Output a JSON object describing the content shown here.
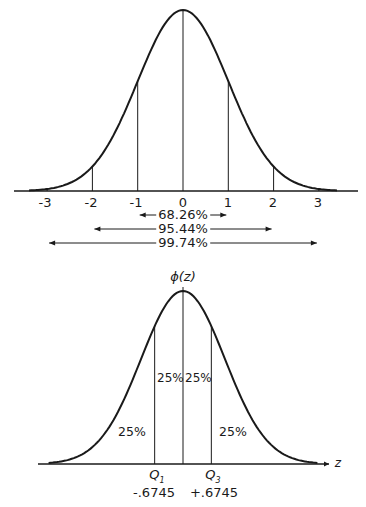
{
  "top_chart": {
    "ticks": [
      "-3",
      "-2",
      "-1",
      "0",
      "1",
      "2",
      "3"
    ],
    "ranges": [
      {
        "label": "68.26%",
        "from": "-1",
        "to": "1"
      },
      {
        "label": "95.44%",
        "from": "-2",
        "to": "2"
      },
      {
        "label": "99.74%",
        "from": "-3",
        "to": "3"
      }
    ]
  },
  "bottom_chart": {
    "y_label": "ϕ(z)",
    "x_label": "z",
    "regions": [
      "25%",
      "25%",
      "25%",
      "25%"
    ],
    "q1": {
      "label": "Q1",
      "value": "-.6745"
    },
    "q3": {
      "label": "Q3",
      "value": "+.6745"
    }
  },
  "chart_data": [
    {
      "type": "area",
      "title": "Standard normal distribution",
      "x": [
        -3,
        -2,
        -1,
        0,
        1,
        2,
        3
      ],
      "xlabel": "",
      "ylabel": "",
      "vertical_lines_at": [
        -2,
        -1,
        0,
        1,
        2
      ],
      "annotations": [
        {
          "text": "68.26%",
          "range": [
            -1,
            1
          ]
        },
        {
          "text": "95.44%",
          "range": [
            -2,
            2
          ]
        },
        {
          "text": "99.74%",
          "range": [
            -3,
            3
          ]
        }
      ]
    },
    {
      "type": "area",
      "title": "Quartiles of standard normal",
      "xlabel": "z",
      "ylabel": "ϕ(z)",
      "vertical_lines_at": [
        -0.6745,
        0,
        0.6745
      ],
      "annotations": [
        {
          "text": "25%",
          "region": "z < -0.6745"
        },
        {
          "text": "25%",
          "region": "-0.6745 < z < 0"
        },
        {
          "text": "25%",
          "region": "0 < z < 0.6745"
        },
        {
          "text": "25%",
          "region": "z > 0.6745"
        },
        {
          "text": "Q1 -.6745",
          "x": -0.6745
        },
        {
          "text": "Q3 +.6745",
          "x": 0.6745
        }
      ]
    }
  ]
}
